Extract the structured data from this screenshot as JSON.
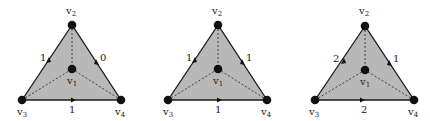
{
  "colors": {
    "fill": "#b8b8b8",
    "edge": "#1a1a1a",
    "vertex": "#111111",
    "text": "#222222",
    "background": "#ffffff"
  },
  "diagrams": [
    {
      "vertices": {
        "v1": {
          "label": "v",
          "sub": "1"
        },
        "v2": {
          "label": "v",
          "sub": "2"
        },
        "v3": {
          "label": "v",
          "sub": "3"
        },
        "v4": {
          "label": "v",
          "sub": "4"
        }
      },
      "edges": {
        "left": "1",
        "right": "0",
        "bottom": "1"
      }
    },
    {
      "vertices": {
        "v1": {
          "label": "v",
          "sub": "1"
        },
        "v2": {
          "label": "v",
          "sub": "2"
        },
        "v3": {
          "label": "v",
          "sub": "3"
        },
        "v4": {
          "label": "v",
          "sub": "4"
        }
      },
      "edges": {
        "left": "1",
        "right": "1",
        "bottom": "1"
      }
    },
    {
      "vertices": {
        "v1": {
          "label": "v",
          "sub": "1"
        },
        "v2": {
          "label": "v",
          "sub": "2"
        },
        "v3": {
          "label": "v",
          "sub": "3"
        },
        "v4": {
          "label": "v",
          "sub": "4"
        }
      },
      "edges": {
        "left": "2",
        "right": "1",
        "bottom": "2"
      }
    }
  ]
}
